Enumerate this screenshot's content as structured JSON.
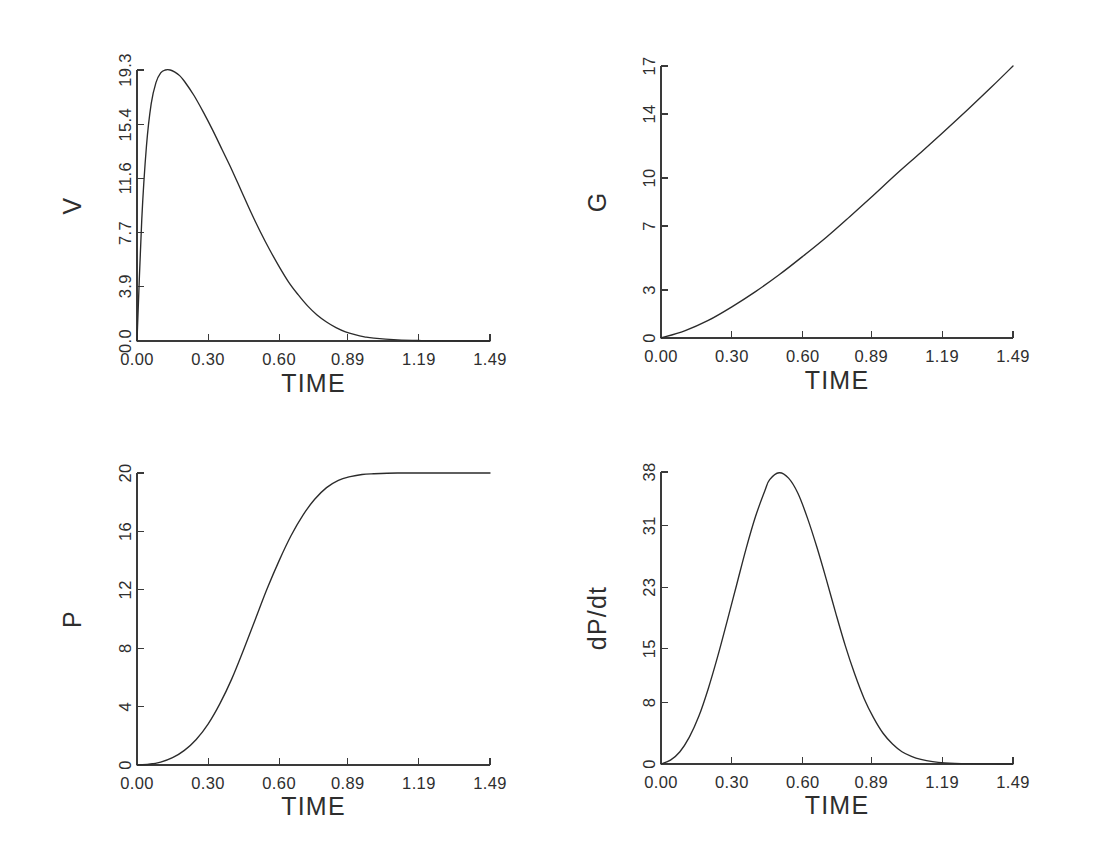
{
  "figure": {
    "background_color": "#ffffff",
    "line_color": "#2b2b2b",
    "axis_color": "#3a3a3a",
    "panel_count": 4
  },
  "chart_data": [
    {
      "type": "line",
      "title": "",
      "panel_name": "V",
      "xlabel": "TIME",
      "ylabel": "V",
      "grid": false,
      "legend": "none",
      "xlim": [
        0.0,
        1.49
      ],
      "ylim": [
        0.0,
        19.3
      ],
      "xticks": [
        0.0,
        0.3,
        0.6,
        0.89,
        1.19,
        1.49
      ],
      "xtick_labels": [
        "0.00",
        "0.30",
        "0.60",
        "0.89",
        "1.19",
        "1.49"
      ],
      "yticks": [
        0.0,
        3.9,
        7.7,
        11.6,
        15.4,
        19.3
      ],
      "ytick_labels": [
        "0.0",
        "3.9",
        "7.7",
        "11.6",
        "15.4",
        "19.3"
      ],
      "x": [
        0.0,
        0.02,
        0.04,
        0.06,
        0.08,
        0.1,
        0.12,
        0.14,
        0.16,
        0.18,
        0.2,
        0.24,
        0.28,
        0.32,
        0.36,
        0.4,
        0.44,
        0.48,
        0.52,
        0.56,
        0.6,
        0.64,
        0.68,
        0.72,
        0.76,
        0.8,
        0.84,
        0.88,
        0.92,
        0.96,
        1.0,
        1.1,
        1.2,
        1.3,
        1.4,
        1.49
      ],
      "y": [
        0.0,
        8.6,
        13.9,
        16.9,
        18.4,
        19.1,
        19.3,
        19.3,
        19.15,
        18.9,
        18.5,
        17.5,
        16.3,
        15.0,
        13.6,
        12.2,
        10.7,
        9.2,
        7.8,
        6.5,
        5.3,
        4.2,
        3.3,
        2.5,
        1.85,
        1.35,
        0.95,
        0.65,
        0.45,
        0.3,
        0.2,
        0.08,
        0.03,
        0.01,
        0.0,
        0.0
      ]
    },
    {
      "type": "line",
      "title": "",
      "panel_name": "G",
      "xlabel": "TIME",
      "ylabel": "G",
      "grid": false,
      "legend": "none",
      "xlim": [
        0.0,
        1.49
      ],
      "ylim": [
        0,
        17
      ],
      "xticks": [
        0.0,
        0.3,
        0.6,
        0.89,
        1.19,
        1.49
      ],
      "xtick_labels": [
        "0.00",
        "0.30",
        "0.60",
        "0.89",
        "1.19",
        "1.49"
      ],
      "yticks": [
        0,
        3,
        7,
        10,
        14,
        17
      ],
      "ytick_labels": [
        "0",
        "3",
        "7",
        "10",
        "14",
        "17"
      ],
      "x": [
        0.0,
        0.1,
        0.2,
        0.3,
        0.4,
        0.5,
        0.6,
        0.7,
        0.8,
        0.89,
        1.0,
        1.1,
        1.19,
        1.3,
        1.4,
        1.49
      ],
      "y": [
        0.0,
        0.45,
        1.1,
        1.95,
        2.9,
        3.95,
        5.1,
        6.3,
        7.6,
        8.8,
        10.3,
        11.6,
        12.8,
        14.3,
        15.7,
        17.0
      ]
    },
    {
      "type": "line",
      "title": "",
      "panel_name": "P",
      "xlabel": "TIME",
      "ylabel": "P",
      "grid": false,
      "legend": "none",
      "xlim": [
        0.0,
        1.49
      ],
      "ylim": [
        0,
        20
      ],
      "xticks": [
        0.0,
        0.3,
        0.6,
        0.89,
        1.19,
        1.49
      ],
      "xtick_labels": [
        "0.00",
        "0.30",
        "0.60",
        "0.89",
        "1.19",
        "1.49"
      ],
      "yticks": [
        0,
        4,
        8,
        12,
        16,
        20
      ],
      "ytick_labels": [
        "0",
        "4",
        "8",
        "12",
        "16",
        "20"
      ],
      "x": [
        0.0,
        0.05,
        0.1,
        0.15,
        0.2,
        0.25,
        0.3,
        0.35,
        0.4,
        0.45,
        0.5,
        0.55,
        0.6,
        0.65,
        0.7,
        0.75,
        0.8,
        0.85,
        0.9,
        0.95,
        1.0,
        1.1,
        1.2,
        1.3,
        1.4,
        1.49
      ],
      "y": [
        0.0,
        0.05,
        0.2,
        0.5,
        1.0,
        1.75,
        2.8,
        4.2,
        5.9,
        7.9,
        10.0,
        12.1,
        14.0,
        15.7,
        17.1,
        18.2,
        19.0,
        19.5,
        19.75,
        19.9,
        19.95,
        20.0,
        20.0,
        20.0,
        20.0,
        20.0
      ]
    },
    {
      "type": "line",
      "title": "",
      "panel_name": "dP/dt",
      "xlabel": "TIME",
      "ylabel": "dP/dt",
      "grid": false,
      "legend": "none",
      "xlim": [
        0.0,
        1.49
      ],
      "ylim": [
        0,
        38
      ],
      "xticks": [
        0.0,
        0.3,
        0.6,
        0.89,
        1.19,
        1.49
      ],
      "xtick_labels": [
        "0.00",
        "0.30",
        "0.60",
        "0.89",
        "1.19",
        "1.49"
      ],
      "yticks": [
        0,
        8,
        15,
        23,
        31,
        38
      ],
      "ytick_labels": [
        "0",
        "8",
        "15",
        "23",
        "31",
        "38"
      ],
      "x": [
        0.0,
        0.04,
        0.08,
        0.12,
        0.16,
        0.2,
        0.24,
        0.28,
        0.32,
        0.36,
        0.4,
        0.44,
        0.46,
        0.5,
        0.54,
        0.58,
        0.62,
        0.66,
        0.7,
        0.74,
        0.78,
        0.82,
        0.86,
        0.9,
        0.94,
        0.98,
        1.02,
        1.06,
        1.1,
        1.15,
        1.2,
        1.3,
        1.4,
        1.49
      ],
      "y": [
        0.0,
        0.5,
        1.6,
        3.5,
        6.2,
        9.8,
        14.0,
        18.6,
        23.3,
        28.0,
        32.2,
        35.6,
        37.0,
        37.9,
        37.2,
        35.2,
        32.0,
        28.2,
        24.0,
        19.6,
        15.4,
        11.7,
        8.5,
        6.0,
        4.0,
        2.6,
        1.6,
        1.0,
        0.6,
        0.3,
        0.15,
        0.04,
        0.01,
        0.0
      ]
    }
  ]
}
